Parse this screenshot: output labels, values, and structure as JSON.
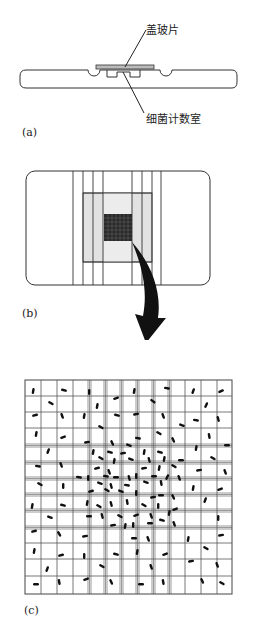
{
  "figure": {
    "panel_a": {
      "label": "(a)",
      "callouts": {
        "cover_slip": "盖玻片",
        "counting_chamber": "细菌计数室"
      }
    },
    "panel_b": {
      "label": "(b)"
    },
    "panel_c": {
      "label": "(c)",
      "grid": {
        "rows": 13,
        "cols": 13
      }
    }
  }
}
